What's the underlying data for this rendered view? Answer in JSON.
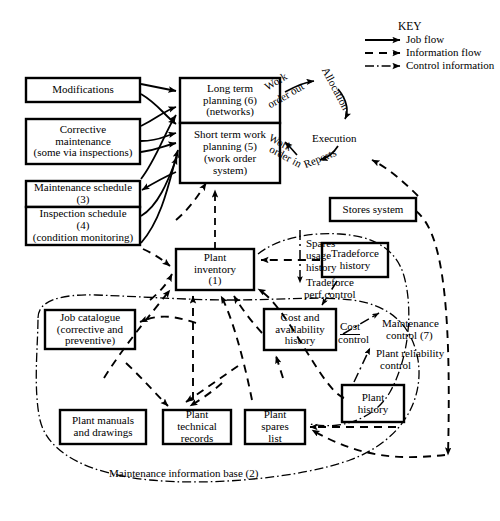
{
  "figure": {
    "caption": "Maintenance information base (2)"
  },
  "key": {
    "title": "KEY",
    "items": [
      {
        "label": "Job flow",
        "style": "solid"
      },
      {
        "label": "Information flow",
        "style": "dashed"
      },
      {
        "label": "Control information",
        "style": "dashdot"
      }
    ]
  },
  "boxes": {
    "modifications": {
      "lines": [
        "Modifications"
      ]
    },
    "corrective": {
      "lines": [
        "Corrective",
        "maintenance",
        "(some via inspections)"
      ]
    },
    "maintenance_schedule": {
      "lines": [
        "Maintenance schedule",
        "(3)"
      ]
    },
    "inspection_schedule": {
      "lines": [
        "Inspection schedule",
        "(4)",
        "(condition monitoring)"
      ]
    },
    "long_term": {
      "lines": [
        "Long term",
        "planning (6)",
        "(networks)"
      ]
    },
    "short_term": {
      "lines": [
        "Short term work",
        "planning (5)",
        "(work order",
        "system)"
      ]
    },
    "plant_inventory": {
      "lines": [
        "Plant",
        "inventory",
        "(1)"
      ]
    },
    "stores_system": {
      "lines": [
        "Stores system"
      ]
    },
    "tradeforce_history": {
      "lines": [
        "Tradeforce",
        "history"
      ]
    },
    "job_catalogue": {
      "lines": [
        "Job catalogue",
        "(corrective and",
        "preventive)"
      ]
    },
    "cost_availability": {
      "lines": [
        "Cost and",
        "availability",
        "history"
      ]
    },
    "plant_manuals": {
      "lines": [
        "Plant manuals",
        "and drawings"
      ]
    },
    "plant_technical": {
      "lines": [
        "Plant",
        "technical",
        "records"
      ]
    },
    "plant_spares": {
      "lines": [
        "Plant",
        "spares",
        "list"
      ]
    },
    "plant_history": {
      "lines": [
        "Plant",
        "history"
      ]
    }
  },
  "labels": {
    "work_order_out": "Work\norder out",
    "work_order_out_l1": "Work",
    "work_order_out_l2": "order out",
    "allocation": "Allocation",
    "execution": "Execution",
    "work_order_in_l1": "Work",
    "work_order_in_l2": "order in",
    "reports": "Reports",
    "spares_usage_l1": "Spares",
    "spares_usage_l2": "usage",
    "spares_usage_l3": "history",
    "tradeforce_perf_l1": "Tradeforce",
    "tradeforce_perf_l2": "perf.control",
    "cost_control_l1": "Cost",
    "cost_control_l2": "control",
    "maintenance_control_l1": "Maintenance",
    "maintenance_control_l2": "control (7)",
    "plant_reliability_l1": "Plant reliability",
    "plant_reliability_l2": "control"
  },
  "colors": {
    "ink": "#000000",
    "paper": "#ffffff"
  }
}
